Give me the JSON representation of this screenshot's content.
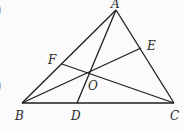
{
  "figure": {
    "type": "triangle-cevians",
    "points": {
      "A": {
        "x": 116,
        "y": 10,
        "label": "A",
        "lx": 111,
        "ly": 8
      },
      "B": {
        "x": 22,
        "y": 103,
        "label": "B",
        "lx": 15,
        "ly": 120
      },
      "C": {
        "x": 174,
        "y": 103,
        "label": "C",
        "lx": 170,
        "ly": 120
      },
      "D": {
        "x": 77,
        "y": 103,
        "label": "D",
        "lx": 71,
        "ly": 120
      },
      "E": {
        "x": 141,
        "y": 48,
        "label": "E",
        "lx": 147,
        "ly": 50
      },
      "F": {
        "x": 62,
        "y": 64,
        "label": "F",
        "lx": 48,
        "ly": 64
      },
      "O": {
        "x": 89,
        "y": 72,
        "label": "O",
        "lx": 88,
        "ly": 90
      }
    },
    "segments": [
      [
        "A",
        "B"
      ],
      [
        "B",
        "C"
      ],
      [
        "C",
        "A"
      ],
      [
        "A",
        "D"
      ],
      [
        "B",
        "E"
      ],
      [
        "C",
        "F"
      ]
    ],
    "margin_marks": [
      ")",
      ")"
    ]
  }
}
